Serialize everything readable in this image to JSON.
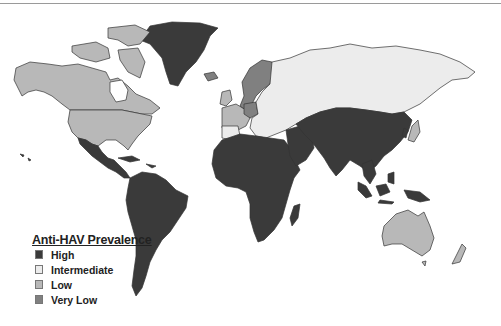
{
  "legend": {
    "title": "Anti-HAV Prevalence",
    "items": [
      {
        "label": "High",
        "color": "#3a3a3a"
      },
      {
        "label": "Intermediate",
        "color": "#ececec"
      },
      {
        "label": "Low",
        "color": "#b8b8b8"
      },
      {
        "label": "Very Low",
        "color": "#808080"
      }
    ]
  },
  "regions": {
    "greenland": "High",
    "north_america_us_canada": "Low",
    "mexico_central_south_america": "High",
    "western_europe": "Low",
    "scandinavia_germany": "Very Low",
    "eastern_europe_russia": "Intermediate",
    "africa_middle_east": "High",
    "asia_south_east": "High",
    "japan": "Low",
    "australia_new_zealand": "Low"
  },
  "caption": ""
}
